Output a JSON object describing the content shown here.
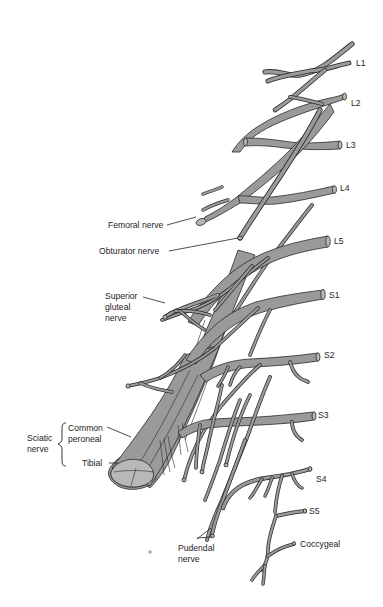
{
  "diagram": {
    "colors": {
      "nerve_fill": "#9a9a9a",
      "nerve_outline": "#2a2a2a",
      "background": "#ffffff",
      "label": "#1e1e1e"
    },
    "root_labels": {
      "l1": "L1",
      "l2": "L2",
      "l3": "L3",
      "l4": "L4",
      "l5": "L5",
      "s1": "S1",
      "s2": "S2",
      "s3": "S3",
      "s4": "S4",
      "s5": "S5",
      "coccygeal": "Coccygeal"
    },
    "nerve_labels": {
      "femoral": "Femoral nerve",
      "obturator": "Obturator nerve",
      "superior_gluteal": [
        "Superior",
        "gluteal",
        "nerve"
      ],
      "sciatic": [
        "Sciatic",
        "nerve"
      ],
      "common_peroneal": [
        "Common",
        "peroneal"
      ],
      "tibial": "Tibial",
      "pudendal": [
        "Pudendal",
        "nerve"
      ]
    }
  }
}
